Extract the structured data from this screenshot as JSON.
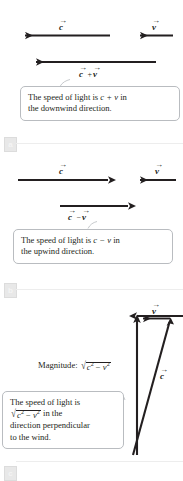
{
  "figure": {
    "panels": [
      {
        "id": "a",
        "badge": "a",
        "vectors": [
          {
            "name": "c-vector",
            "symbol": "c",
            "direction": "left"
          },
          {
            "name": "v-vector",
            "symbol": "v",
            "direction": "left"
          },
          {
            "name": "resultant-vector",
            "symbol": "c + v",
            "direction": "left"
          }
        ],
        "resultant_label": {
          "left": "c",
          "op": "+",
          "right": "v"
        },
        "caption": {
          "line1_pre": "The speed of light is ",
          "line1_math": "c + v",
          "line1_post": " in",
          "line2": "the downwind direction."
        }
      },
      {
        "id": "b",
        "badge": "b",
        "vectors": [
          {
            "name": "c-vector",
            "symbol": "c",
            "direction": "right"
          },
          {
            "name": "v-vector",
            "symbol": "v",
            "direction": "left"
          },
          {
            "name": "resultant-vector",
            "symbol": "c - v",
            "direction": "right"
          }
        ],
        "resultant_label": {
          "left": "c",
          "op": "−",
          "right": "v"
        },
        "caption": {
          "line1_pre": "The speed of light is ",
          "line1_math": "c − v",
          "line1_post": " in",
          "line2": "the upwind direction."
        }
      },
      {
        "id": "c",
        "badge": "c",
        "vectors": [
          {
            "name": "v-vector",
            "symbol": "v",
            "direction": "left"
          },
          {
            "name": "c-vector",
            "symbol": "c",
            "direction": "up-right"
          },
          {
            "name": "resultant-vector",
            "symbol": "",
            "direction": "up"
          }
        ],
        "magnitude": {
          "label": "Magnitude:",
          "radicand_a": "c",
          "exp_a": "2",
          "op": " − ",
          "radicand_b": "v",
          "exp_b": "2"
        },
        "caption": {
          "line1": "The speed of light is",
          "line2_radicand_a": "c",
          "line2_exp_a": "2",
          "line2_op": " − ",
          "line2_radicand_b": "v",
          "line2_exp_b": "2",
          "line2_post": " in the",
          "line3": "direction perpendicular",
          "line4": "to the wind."
        }
      }
    ],
    "symbols": {
      "c": "c",
      "v": "v",
      "vector_arrow": "→",
      "plus": "+",
      "minus": "−"
    },
    "colors": {
      "ink": "#231f20",
      "box_border": "#b9bcc0",
      "badge_bg": "#e8e8e8",
      "rule": "#ededed",
      "background": "#ffffff"
    }
  }
}
